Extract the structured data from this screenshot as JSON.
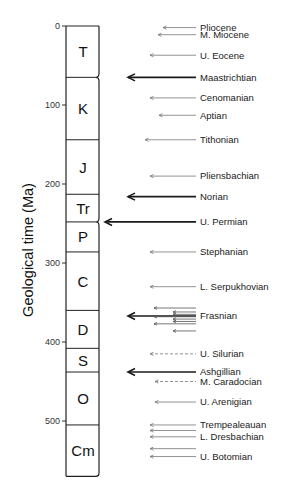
{
  "chart_data": {
    "type": "diagram",
    "title": "",
    "ylabel": "Geological time (Ma)",
    "ylim": [
      0,
      570
    ],
    "y_ticks": [
      0,
      100,
      200,
      300,
      400,
      500
    ],
    "periods": [
      {
        "label": "T",
        "start": 0,
        "end": 65
      },
      {
        "label": "K",
        "start": 65,
        "end": 144
      },
      {
        "label": "J",
        "start": 144,
        "end": 213
      },
      {
        "label": "Tr",
        "start": 213,
        "end": 248
      },
      {
        "label": "P",
        "start": 248,
        "end": 286
      },
      {
        "label": "C",
        "start": 286,
        "end": 360
      },
      {
        "label": "D",
        "start": 360,
        "end": 408
      },
      {
        "label": "S",
        "start": 408,
        "end": 438
      },
      {
        "label": "O",
        "start": 438,
        "end": 505
      },
      {
        "label": "Cm",
        "start": 505,
        "end": 570
      }
    ],
    "events": [
      {
        "label": "Pliocene",
        "age": 2,
        "style": "thin"
      },
      {
        "label": "M. Miocene",
        "age": 11,
        "style": "thin"
      },
      {
        "label": "U. Eocene",
        "age": 37,
        "style": "thin"
      },
      {
        "label": "Maastrichtian",
        "age": 65,
        "style": "major"
      },
      {
        "label": "Cenomanian",
        "age": 91,
        "style": "thin"
      },
      {
        "label": "Aptian",
        "age": 113,
        "style": "thin"
      },
      {
        "label": "Tithonian",
        "age": 144,
        "style": "thin"
      },
      {
        "label": "Pliensbachian",
        "age": 190,
        "style": "thin"
      },
      {
        "label": "Norian",
        "age": 216,
        "style": "major"
      },
      {
        "label": "U. Permian",
        "age": 248,
        "style": "major"
      },
      {
        "label": "Stephanian",
        "age": 286,
        "style": "thin"
      },
      {
        "label": "L. Serpukhovian",
        "age": 330,
        "style": "thin"
      },
      {
        "label": "Frasnian",
        "age": 367,
        "style": "major"
      },
      {
        "label": "U. Silurian",
        "age": 415,
        "style": "dashed"
      },
      {
        "label": "Ashgillian",
        "age": 438,
        "style": "major"
      },
      {
        "label": "M. Caradocian",
        "age": 450,
        "style": "dashed"
      },
      {
        "label": "U. Arenigian",
        "age": 476,
        "style": "thin"
      },
      {
        "label": "Trempealeauan",
        "age": 505,
        "style": "thin"
      },
      {
        "label": "",
        "age": 512,
        "style": "thin"
      },
      {
        "label": "L. Dresbachian",
        "age": 520,
        "style": "thin"
      },
      {
        "label": "",
        "age": 535,
        "style": "thin"
      },
      {
        "label": "U. Botomian",
        "age": 545,
        "style": "thin"
      }
    ],
    "frasnian_cluster_ages": [
      357,
      362,
      365,
      368,
      371,
      374,
      377,
      386
    ]
  },
  "colors": {
    "line": "#222222",
    "thin_arrow": "#666666",
    "text": "#1a1a1a"
  }
}
